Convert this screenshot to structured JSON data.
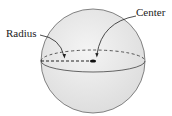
{
  "diagram": {
    "labels": {
      "radius": "Radius",
      "center": "Center"
    },
    "colors": {
      "fill": "#e6e6e6",
      "stroke": "#555555",
      "center_dot": "#111111"
    }
  }
}
